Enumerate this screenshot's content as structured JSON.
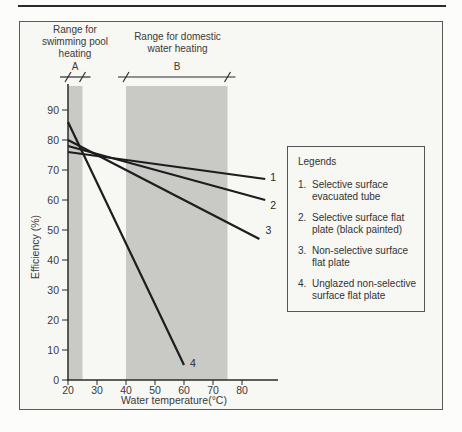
{
  "page": {
    "background": "#fcfcfa",
    "top_rule_color": "#2a2a2a"
  },
  "figure_frame": {
    "border_color": "#5a5a5a",
    "background": "#f7f7f4"
  },
  "annotations": {
    "range_a": {
      "lines": [
        "Range for",
        "swimming pool",
        "heating"
      ],
      "dim_label": "A"
    },
    "range_b": {
      "lines": [
        "Range for domestic",
        "water heating"
      ],
      "dim_label": "B"
    }
  },
  "legend": {
    "title": "Legends",
    "items": [
      {
        "num": "1.",
        "text": "Selective surface evacuated tube"
      },
      {
        "num": "2.",
        "text": "Selective surface flat plate (black painted)"
      },
      {
        "num": "3.",
        "text": "Non-selective surface flat plate"
      },
      {
        "num": "4.",
        "text": "Unglazed non-selective surface flat plate"
      }
    ]
  },
  "chart_data": {
    "type": "line",
    "title": "",
    "xlabel": "Water temperature(°C)",
    "ylabel": "Efficiency (%)",
    "xlim": [
      20,
      92
    ],
    "ylim": [
      0,
      100
    ],
    "x_ticks": [
      20,
      30,
      40,
      50,
      60,
      70,
      80
    ],
    "y_ticks": [
      0,
      10,
      20,
      30,
      40,
      50,
      60,
      70,
      80,
      90
    ],
    "grid": false,
    "legend_position": "right-box",
    "bands": [
      {
        "label": "A",
        "range_label": "Range for swimming pool heating",
        "x0": 20,
        "x1": 25
      },
      {
        "label": "B",
        "range_label": "Range for domestic water heating",
        "x0": 40,
        "x1": 75
      }
    ],
    "series": [
      {
        "id": "1",
        "name": "Selective surface evacuated tube",
        "points": [
          [
            20,
            76
          ],
          [
            88,
            67
          ]
        ]
      },
      {
        "id": "2",
        "name": "Selective surface flat plate (black painted)",
        "points": [
          [
            20,
            78
          ],
          [
            88,
            60
          ]
        ]
      },
      {
        "id": "3",
        "name": "Non-selective surface flat plate",
        "points": [
          [
            20,
            80
          ],
          [
            86,
            47
          ]
        ]
      },
      {
        "id": "4",
        "name": "Unglazed non-selective surface flat plate",
        "points": [
          [
            20,
            86
          ],
          [
            60,
            5
          ]
        ]
      }
    ],
    "colors": {
      "band_fill": "#c9c9c6",
      "series_line": "#1d1d1d",
      "axis": "#2b2b2b",
      "text": "#3a3a3a"
    }
  }
}
